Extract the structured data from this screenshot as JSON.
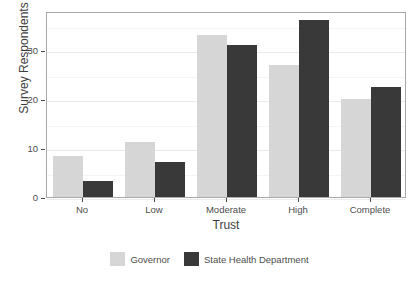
{
  "chart_data": {
    "type": "bar",
    "title": "",
    "subtitle": "",
    "xlabel": "Trust",
    "ylabel": "Survey Respondents (%)",
    "categories": [
      "No",
      "Low",
      "Moderate",
      "High",
      "Complete"
    ],
    "series": [
      {
        "name": "Governor",
        "color": "#d6d6d6",
        "values": [
          8.4,
          11.2,
          33.0,
          27.0,
          20.0
        ]
      },
      {
        "name": "State Health Department",
        "color": "#393939",
        "values": [
          3.3,
          7.2,
          31.0,
          36.2,
          22.4
        ]
      }
    ],
    "ylim": [
      0,
      38
    ],
    "yticks": [
      0,
      10,
      20,
      30
    ],
    "ytick_labels": [
      "0",
      "10",
      "20",
      "30"
    ],
    "grid": true,
    "grid_color": "#ebebeb",
    "legend_position": "bottom",
    "panel_border_color": "#a8a8a8",
    "background": "#ffffff"
  },
  "axis": {
    "y_title": "Survey Respondents (%)",
    "x_title": "Trust"
  },
  "legend": {
    "entries": [
      {
        "label": "Governor"
      },
      {
        "label": "State Health Department"
      }
    ]
  }
}
